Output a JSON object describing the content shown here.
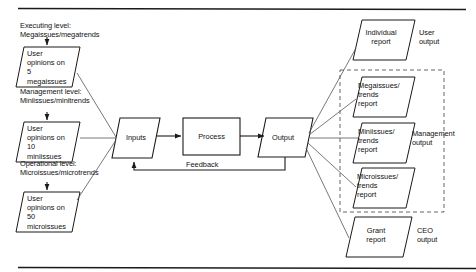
{
  "diagram": {
    "type": "flowchart",
    "title": "",
    "rules": {
      "top_rule": true,
      "bottom_rule": true
    },
    "level_labels": [
      {
        "line1": "Executing level:",
        "line2": "Megaissues/megatrends"
      },
      {
        "line1": "Management level:",
        "line2": "Miniissues/minitrends"
      },
      {
        "line1": "Operational level:",
        "line2": "Microissues/microtrends"
      }
    ],
    "input_sources": [
      {
        "line1": "User",
        "line2": "opinions on",
        "line3": "5",
        "line4": "megaissues"
      },
      {
        "line1": "User",
        "line2": "opinions on",
        "line3": "10",
        "line4": "miniissues"
      },
      {
        "line1": "User",
        "line2": "opinions on",
        "line3": "50",
        "line4": "microissues"
      }
    ],
    "process_chain": [
      {
        "label": "Inputs",
        "shape": "parallelogram"
      },
      {
        "label": "Process",
        "shape": "rectangle"
      },
      {
        "label": "Output",
        "shape": "parallelogram"
      }
    ],
    "feedback_label": "Feedback",
    "outputs": [
      {
        "line1": "Individual",
        "line2": "report",
        "line3": ""
      },
      {
        "line1": "Megaissues/",
        "line2": "trends",
        "line3": "report"
      },
      {
        "line1": "Miniissues/",
        "line2": "trends",
        "line3": "report"
      },
      {
        "line1": "Microissues/",
        "line2": "trends",
        "line3": "report"
      },
      {
        "line1": "Grant",
        "line2": "report",
        "line3": ""
      }
    ],
    "output_groups": [
      {
        "line1": "User",
        "line2": "output"
      },
      {
        "line1": "Management",
        "line2": "output"
      },
      {
        "line1": "CEO",
        "line2": "output"
      }
    ],
    "colors": {
      "stroke": "#1a1a1a",
      "text": "#111111",
      "background": "#ffffff",
      "dashed_group": "#555555"
    }
  }
}
